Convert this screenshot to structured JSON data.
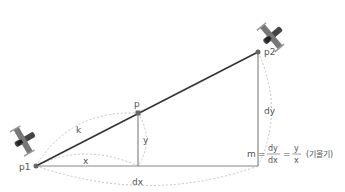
{
  "diagram": {
    "points": {
      "p1": {
        "label": "p1",
        "x": 36,
        "y": 166
      },
      "p": {
        "label": "p",
        "x": 138,
        "y": 113
      },
      "p2": {
        "label": "p2",
        "x": 258,
        "y": 52
      }
    },
    "segments": {
      "k": "k",
      "x": "x",
      "y": "y",
      "dx": "dx",
      "dy": "dy"
    },
    "formula": {
      "lhs": "m",
      "eq1": "=",
      "num1": "dy",
      "den1": "dx",
      "eq2": "=",
      "num2": "y",
      "den2": "x",
      "note": "(기울기)"
    },
    "colors": {
      "main_line": "#333333",
      "guide_line": "#888888",
      "dashed_arc": "#bbbbbb",
      "point": "#666666"
    }
  }
}
